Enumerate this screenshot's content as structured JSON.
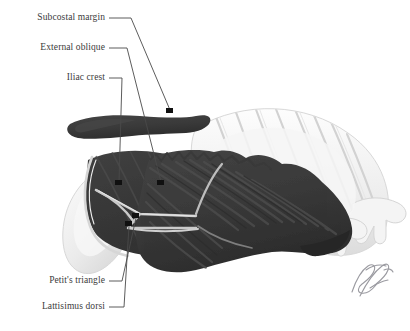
{
  "figure": {
    "background_color": "#ffffff",
    "width": 410,
    "height": 331
  },
  "palette": {
    "muscle_dark": "#3a3a3a",
    "muscle_shadow": "#2b2b2b",
    "muscle_highlight": "#4d4d4d",
    "bone_light": "#ededed",
    "bone_outline": "#cfcfcf",
    "bone_shade": "#dcdcdc",
    "leader_line": "#4a4a4a",
    "label_text": "#3b3b3b",
    "endpoint_dot": "#101010",
    "signature": "#9a9aa0",
    "triangle_outline": "#c9c9c9"
  },
  "labels": [
    {
      "id": "subcostal-margin",
      "text": "Subcostal margin",
      "text_x": 105,
      "text_y": 22,
      "leader": "M109,18 L131,18 L170,110",
      "dot_x": 170,
      "dot_y": 112
    },
    {
      "id": "external-oblique",
      "text": "External oblique",
      "text_x": 105,
      "text_y": 52,
      "leader": "M109,48 L127,48 L161,182",
      "dot_x": 161,
      "dot_y": 184
    },
    {
      "id": "iliac-crest",
      "text": "Iliac crest",
      "text_x": 105,
      "text_y": 82,
      "leader": "M109,78 L122,78 L119,182",
      "dot_x": 118,
      "dot_y": 184
    },
    {
      "id": "petits-triangle",
      "text": "Petit's triangle",
      "text_x": 105,
      "text_y": 285,
      "leader": "M109,281 L122,281 L136,218",
      "dot_x": 136,
      "dot_y": 216
    },
    {
      "id": "lattisimus-dorsi",
      "text": "Lattisimus dorsi",
      "text_x": 105,
      "text_y": 311,
      "leader": "M109,307 L124,307 L129,226",
      "dot_x": 129,
      "dot_y": 224
    }
  ],
  "structures": [
    {
      "id": "iliac-crest-bar",
      "name": "Iliac crest",
      "tone": "muscle_dark"
    },
    {
      "id": "external-oblique-muscle",
      "name": "External oblique",
      "tone": "muscle_dark"
    },
    {
      "id": "latissimus-dorsi-muscle",
      "name": "Latissimus dorsi",
      "tone": "muscle_dark"
    },
    {
      "id": "ribcage",
      "name": "Ribs and costal cartilages",
      "tone": "bone_light"
    },
    {
      "id": "ilium-bone",
      "name": "Ilium",
      "tone": "bone_light"
    },
    {
      "id": "petits-triangle-outline",
      "name": "Petit's triangle",
      "tone": "triangle_outline"
    }
  ],
  "signature": {
    "present": true,
    "description": "artist cursive signature",
    "x": 352,
    "y": 268
  }
}
